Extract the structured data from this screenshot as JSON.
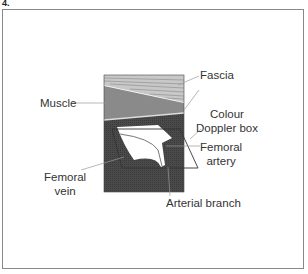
{
  "figure": {
    "number_label": "4."
  },
  "labels": {
    "fascia": "Fascia",
    "muscle": "Muscle",
    "colour_doppler_line1": "Colour",
    "colour_doppler_line2": "Doppler box",
    "femoral_artery_line1": "Femoral",
    "femoral_artery_line2": "artery",
    "femoral_vein_line1": "Femoral",
    "femoral_vein_line2": "vein",
    "arterial_branch": "Arterial branch"
  },
  "colors": {
    "fascia": "#c8c8c8",
    "muscle": "#8a8a8a",
    "deep": "#4a4a4a",
    "vessel": "#ffffff",
    "line": "#333333"
  }
}
